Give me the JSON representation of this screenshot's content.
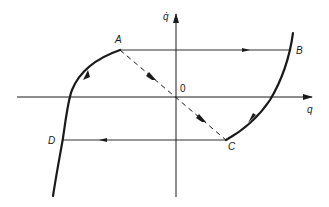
{
  "figure": {
    "type": "phase-plane-hysteresis-loop",
    "axes": {
      "x_label": "q",
      "y_label": "q̇",
      "origin_label": "0"
    },
    "points": {
      "A": "A",
      "B": "B",
      "C": "C",
      "D": "D"
    },
    "colors": {
      "ink": "#1a1a1a",
      "background": "#ffffff"
    }
  }
}
